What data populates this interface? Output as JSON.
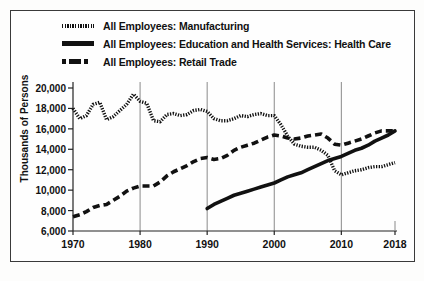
{
  "chart_data": {
    "type": "line",
    "title": "",
    "xlabel": "",
    "ylabel": "Thousands of Persons",
    "xlim": [
      1970,
      2018
    ],
    "ylim": [
      6000,
      20000
    ],
    "yticks": [
      "6,000",
      "8,000",
      "10,000",
      "12,000",
      "14,000",
      "16,000",
      "18,000",
      "20,000"
    ],
    "ytick_values": [
      6000,
      8000,
      10000,
      12000,
      14000,
      16000,
      18000,
      20000
    ],
    "xticks": [
      "1970",
      "1980",
      "1990",
      "2000",
      "2010",
      "2018"
    ],
    "xtick_values": [
      1970,
      1980,
      1990,
      2000,
      2010,
      2018
    ],
    "grid": "vertical-only",
    "legend_position": "top",
    "series": [
      {
        "name": "All Employees: Manufacturing",
        "style": "dotted",
        "color": "#111111",
        "x": [
          1970,
          1971,
          1972,
          1973,
          1974,
          1975,
          1976,
          1977,
          1978,
          1979,
          1980,
          1981,
          1982,
          1983,
          1984,
          1985,
          1986,
          1987,
          1988,
          1989,
          1990,
          1991,
          1992,
          1993,
          1994,
          1995,
          1996,
          1997,
          1998,
          1999,
          2000,
          2001,
          2002,
          2003,
          2004,
          2005,
          2006,
          2007,
          2008,
          2009,
          2010,
          2011,
          2012,
          2013,
          2014,
          2015,
          2016,
          2017,
          2018
        ],
        "values": [
          18000,
          17000,
          17300,
          18400,
          18600,
          16900,
          17200,
          17800,
          18400,
          19400,
          18700,
          18500,
          16800,
          16700,
          17400,
          17500,
          17300,
          17400,
          17800,
          17900,
          17700,
          17000,
          16800,
          16800,
          17000,
          17300,
          17200,
          17400,
          17500,
          17300,
          17300,
          16400,
          15300,
          14500,
          14300,
          14200,
          14200,
          13900,
          13400,
          11900,
          11500,
          11700,
          11900,
          12000,
          12200,
          12300,
          12300,
          12500,
          12700
        ]
      },
      {
        "name": "All Employees: Education and Health Services: Health Care",
        "style": "solid",
        "color": "#111111",
        "x": [
          1990,
          1991,
          1992,
          1993,
          1994,
          1995,
          1996,
          1997,
          1998,
          1999,
          2000,
          2001,
          2002,
          2003,
          2004,
          2005,
          2006,
          2007,
          2008,
          2009,
          2010,
          2011,
          2012,
          2013,
          2014,
          2015,
          2016,
          2017,
          2018
        ],
        "values": [
          8200,
          8600,
          8900,
          9200,
          9500,
          9700,
          9900,
          10100,
          10300,
          10500,
          10700,
          11000,
          11300,
          11500,
          11700,
          12000,
          12300,
          12600,
          12900,
          13100,
          13300,
          13600,
          13900,
          14100,
          14400,
          14800,
          15100,
          15400,
          15800
        ]
      },
      {
        "name": "All Employees: Retail Trade",
        "style": "dashed",
        "color": "#111111",
        "x": [
          1970,
          1971,
          1972,
          1973,
          1974,
          1975,
          1976,
          1977,
          1978,
          1979,
          1980,
          1981,
          1982,
          1983,
          1984,
          1985,
          1986,
          1987,
          1988,
          1989,
          1990,
          1991,
          1992,
          1993,
          1994,
          1995,
          1996,
          1997,
          1998,
          1999,
          2000,
          2001,
          2002,
          2003,
          2004,
          2005,
          2006,
          2007,
          2008,
          2009,
          2010,
          2011,
          2012,
          2013,
          2014,
          2015,
          2016,
          2017,
          2018
        ],
        "values": [
          7400,
          7600,
          7900,
          8300,
          8500,
          8600,
          9000,
          9400,
          9900,
          10200,
          10400,
          10400,
          10400,
          10800,
          11400,
          11800,
          12100,
          12400,
          12800,
          13100,
          13200,
          13000,
          13100,
          13400,
          13900,
          14200,
          14400,
          14600,
          14900,
          15200,
          15400,
          15300,
          15100,
          15000,
          15100,
          15300,
          15400,
          15500,
          15100,
          14500,
          14400,
          14600,
          14800,
          15000,
          15300,
          15600,
          15800,
          15800,
          15800
        ]
      }
    ]
  },
  "legend": {
    "items": [
      {
        "label": "All Employees: Manufacturing",
        "key": "dotted-line-key"
      },
      {
        "label": "All Employees: Education and Health Services: Health Care",
        "key": "solid-line-key"
      },
      {
        "label": "All Employees: Retail Trade",
        "key": "dash-dot-line-key"
      }
    ]
  }
}
